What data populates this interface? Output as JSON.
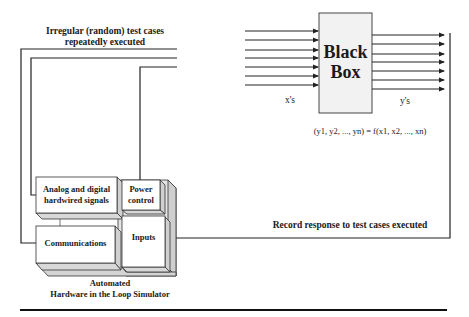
{
  "diagram": {
    "top_label": [
      "Irregular (random) test cases",
      "repeatedly executed"
    ],
    "black_box": {
      "title": [
        "Black",
        "Box"
      ],
      "inputs_label": "x's",
      "outputs_label": "y's",
      "input_count": 7,
      "output_count": 7,
      "fill": "#f2f2f2"
    },
    "equation": "(y1, y2, ..., yn) = f(x1, x2, ..., xn)",
    "record_label": "Record response to test cases executed",
    "simulator": {
      "blocks": {
        "analog": [
          "Analog and digital",
          "hardwired signals"
        ],
        "power": [
          "Power",
          "control"
        ],
        "communications": "Communications",
        "inputs": "Inputs"
      },
      "caption": [
        "Automated",
        "Hardware in the Loop Simulator"
      ]
    },
    "colors": {
      "line": "#222222",
      "box_front": "#ffffff",
      "box_side": "#d9d9d9"
    }
  }
}
